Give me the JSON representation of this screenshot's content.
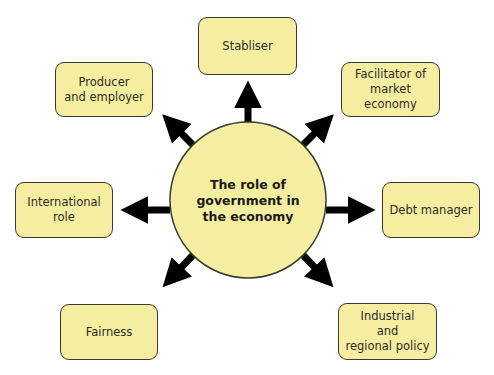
{
  "diagram": {
    "center": {
      "label": "The role of\ngovernment in\nthe economy"
    },
    "nodes": [
      {
        "id": "stabliser",
        "label": "Stabliser",
        "position": "top"
      },
      {
        "id": "producer",
        "label": "Producer\nand employer",
        "position": "top-left"
      },
      {
        "id": "facilitator",
        "label": "Facilitator of\nmarket economy",
        "position": "top-right"
      },
      {
        "id": "international",
        "label": "International\nrole",
        "position": "left"
      },
      {
        "id": "debt",
        "label": "Debt manager",
        "position": "right"
      },
      {
        "id": "fairness",
        "label": "Fairness",
        "position": "bottom-left"
      },
      {
        "id": "industrial",
        "label": "Industrial\nand\nregional policy",
        "position": "bottom-right"
      }
    ],
    "colors": {
      "fill": "#f5eea0",
      "stroke": "#3a3a2a",
      "arrow": "#000000"
    }
  }
}
